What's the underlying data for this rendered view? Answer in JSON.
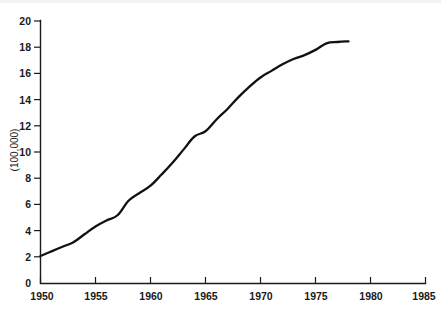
{
  "chart_data": {
    "type": "line",
    "title": "",
    "xlabel": "",
    "ylabel": "(100,000)",
    "xlim": [
      1950,
      1985
    ],
    "ylim": [
      0,
      20
    ],
    "grid": false,
    "legend": null,
    "xticks": [
      1950,
      1955,
      1960,
      1965,
      1970,
      1975,
      1980,
      1985
    ],
    "xtick_labels": [
      "1950",
      "1955",
      "1960",
      "1965",
      "1970",
      "1975",
      "1980",
      "1985"
    ],
    "yticks": [
      0,
      2,
      4,
      6,
      8,
      10,
      12,
      14,
      16,
      18,
      20
    ],
    "ytick_labels": [
      "0",
      "2",
      "4",
      "6",
      "8",
      "10",
      "12",
      "14",
      "16",
      "18",
      "20"
    ],
    "series": [
      {
        "name": "value",
        "color": "#111111",
        "x": [
          1950,
          1951,
          1952,
          1953,
          1954,
          1955,
          1956,
          1957,
          1958,
          1959,
          1960,
          1961,
          1962,
          1963,
          1964,
          1965,
          1966,
          1967,
          1968,
          1969,
          1970,
          1971,
          1972,
          1973,
          1974,
          1975,
          1976,
          1977,
          1978
        ],
        "values": [
          2.1,
          2.45,
          2.8,
          3.15,
          3.75,
          4.35,
          4.8,
          5.2,
          6.3,
          6.9,
          7.45,
          8.3,
          9.2,
          10.2,
          11.2,
          11.6,
          12.5,
          13.3,
          14.2,
          15.0,
          15.7,
          16.2,
          16.7,
          17.1,
          17.4,
          17.8,
          18.3,
          18.4,
          18.45
        ]
      }
    ]
  },
  "axis": {
    "y_title": "(100,000)"
  },
  "caption": {
    "text": ""
  }
}
